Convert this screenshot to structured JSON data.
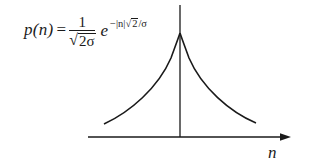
{
  "diagram": {
    "formula": {
      "lhs": "p(n)",
      "equals": "=",
      "fraction_numerator": "1",
      "fraction_denominator_sqrt_symbol": "√",
      "fraction_denominator": "2σ",
      "exp_base": "e",
      "exponent_prefix": "−|n|",
      "exponent_sqrt_symbol": "√",
      "exponent_sqrt_arg": "2",
      "exponent_suffix": "/σ"
    },
    "axis": {
      "x_label": "n",
      "has_arrow": true
    },
    "curve": {
      "shape": "symmetric exponential decay (Laplacian)",
      "peak_at": "n = 0"
    },
    "colors": {
      "stroke": "#1a1a1a",
      "background": "#ffffff"
    }
  }
}
